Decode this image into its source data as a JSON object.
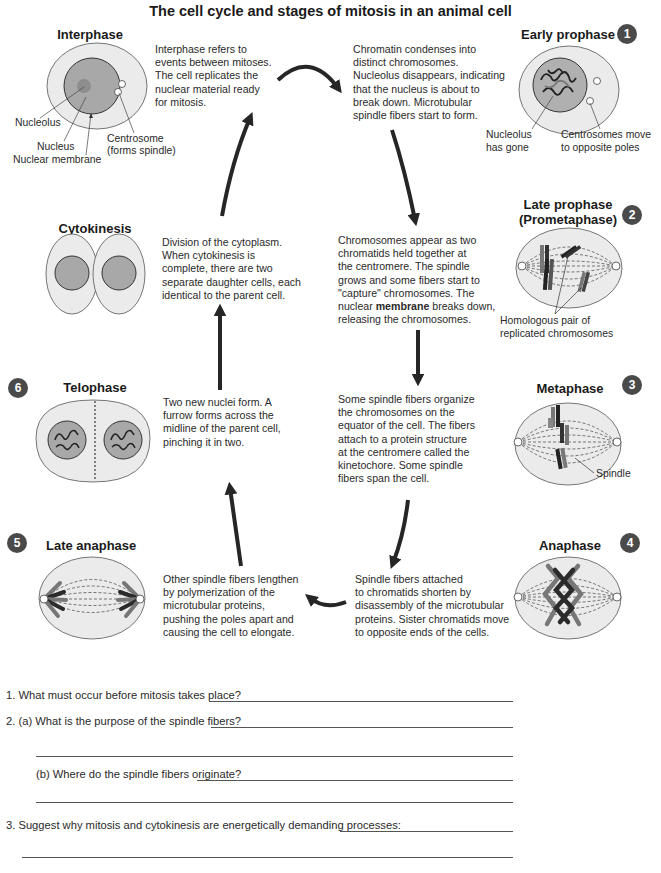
{
  "title": "The cell cycle and stages of mitosis in an animal cell",
  "colors": {
    "cytoplasm": "#ebebeb",
    "nucleus": "#a9a9a9",
    "badge": "#4a4a4a",
    "arrow": "#262626",
    "chromosome_dark": "#2b2b2b",
    "chromosome_grey": "#7a7a7a"
  },
  "stages": {
    "interphase": {
      "name": "Interphase",
      "description": [
        "Interphase refers to",
        "events between mitoses.",
        "The cell replicates the",
        "nuclear material ready",
        "for mitosis."
      ],
      "labels": {
        "nucleolus": "Nucleolus",
        "nucleus": "Nucleus",
        "nuclear_membrane": "Nuclear membrane",
        "centrosome_1": "Centrosome",
        "centrosome_2": "(forms spindle)"
      }
    },
    "early_prophase": {
      "number": "1",
      "name": "Early prophase",
      "description": [
        "Chromatin condenses into",
        "distinct chromosomes.",
        "Nucleolus disappears, indicating",
        "that the nucleus is about to",
        "break down. Microtubular",
        "spindle fibers start to form."
      ],
      "labels": {
        "nucleolus_1": "Nucleolus",
        "nucleolus_2": "has gone",
        "centrosomes_1": "Centrosomes move",
        "centrosomes_2": "to opposite poles"
      }
    },
    "late_prophase": {
      "number": "2",
      "name_1": "Late prophase",
      "name_2": "(Prometaphase)",
      "description": [
        "Chromosomes appear as two",
        "chromatids held together at",
        "the centromere. The spindle",
        "grows and some fibers start to",
        "\"capture\" chromosomes. The"
      ],
      "description_line6_pre": "nuclear ",
      "description_line6_bold": "membrane",
      "description_line6_post": " breaks down,",
      "description_line7": "releasing the chromosomes.",
      "labels": {
        "homologous_1": "Homologous pair of",
        "homologous_2": "replicated chromosomes"
      }
    },
    "metaphase": {
      "number": "3",
      "name": "Metaphase",
      "description": [
        "Some spindle fibers organize",
        "the chromosomes on the",
        "equator of the cell. The fibers",
        "attach to a protein structure",
        "at the centromere called the",
        "kinetochore. Some spindle",
        "fibers span the cell."
      ],
      "labels": {
        "spindle": "Spindle"
      }
    },
    "anaphase": {
      "number": "4",
      "name": "Anaphase",
      "description": [
        "Spindle fibers attached",
        "to chromatids shorten by",
        "disassembly of the microtubular",
        "proteins. Sister chromatids move",
        "to opposite ends of the cells."
      ]
    },
    "late_anaphase": {
      "number": "5",
      "name": "Late anaphase",
      "description": [
        "Other spindle fibers lengthen",
        "by polymerization of the",
        "microtubular proteins,",
        "pushing the poles apart and",
        "causing the cell to elongate."
      ]
    },
    "telophase": {
      "number": "6",
      "name": "Telophase",
      "description": [
        "Two new nuclei form. A",
        "furrow forms across the",
        "midline of the parent cell,",
        "pinching it in two."
      ]
    },
    "cytokinesis": {
      "name": "Cytokinesis",
      "description": [
        "Division of the cytoplasm.",
        "When cytokinesis is",
        "complete, there are two",
        "separate daughter cells, each",
        "identical to the parent cell."
      ]
    }
  },
  "questions": {
    "q1": "1.  What must occur before mitosis takes place?",
    "q2a": "2.  (a) What is the purpose of the spindle fibers?",
    "q2b": "(b) Where do the spindle fibers originate?",
    "q3": "3.  Suggest why mitosis and cytokinesis are energetically demanding processes:"
  }
}
